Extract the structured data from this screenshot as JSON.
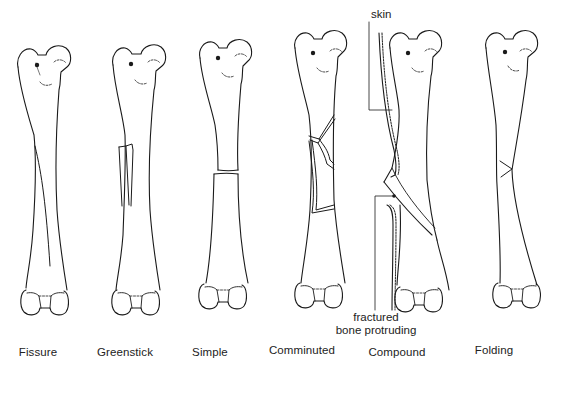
{
  "figure": {
    "colors": {
      "line": "#1a1a1a",
      "background": "#ffffff"
    },
    "bones": [
      {
        "id": "fissure",
        "label": "Fissure",
        "label_x": 38
      },
      {
        "id": "greenstick",
        "label": "Greenstick",
        "label_x": 125
      },
      {
        "id": "simple",
        "label": "Simple",
        "label_x": 210
      },
      {
        "id": "comminuted",
        "label": "Comminuted",
        "label_x": 302
      },
      {
        "id": "compound",
        "label": "Compound",
        "label_x": 397
      },
      {
        "id": "folding",
        "label": "Folding",
        "label_x": 494
      }
    ],
    "annotations": {
      "skin": "skin",
      "fractured_line1": "fractured",
      "fractured_line2": "bone protruding"
    }
  }
}
